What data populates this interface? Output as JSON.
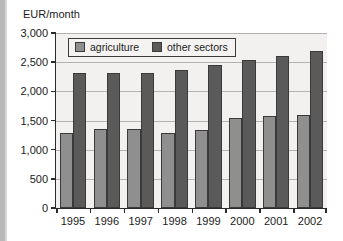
{
  "chart_data": {
    "type": "bar",
    "title": "",
    "xlabel": "",
    "ylabel": "EUR/month",
    "categories": [
      "1995",
      "1996",
      "1997",
      "1998",
      "1999",
      "2000",
      "2001",
      "2002"
    ],
    "series": [
      {
        "name": "agriculture",
        "color": "#8f8f8f",
        "values": [
          1290,
          1350,
          1350,
          1280,
          1340,
          1540,
          1580,
          1595
        ]
      },
      {
        "name": "other sectors",
        "color": "#5a5a5a",
        "values": [
          2320,
          2320,
          2310,
          2365,
          2450,
          2530,
          2600,
          2690
        ]
      }
    ],
    "ylim": [
      0,
      3000
    ],
    "ytick_values": [
      0,
      500,
      1000,
      1500,
      2000,
      2500,
      3000
    ],
    "ytick_labels": [
      "0",
      "500",
      "1,000",
      "1,500",
      "2,000",
      "2,500",
      "3,000"
    ],
    "grid": true,
    "legend_position": "top-left-inside",
    "legend_entries": [
      "agriculture",
      "other sectors"
    ]
  },
  "axis_caption": "EUR/month"
}
